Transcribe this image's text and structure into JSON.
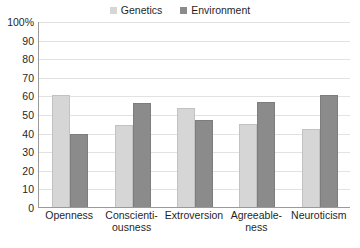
{
  "chart_data": {
    "type": "bar",
    "title": "",
    "xlabel": "",
    "ylabel": "",
    "ylim": [
      0,
      100
    ],
    "yticks": [
      "0",
      "10",
      "20",
      "30",
      "40",
      "50",
      "60",
      "70",
      "80",
      "90",
      "100%"
    ],
    "grid": true,
    "legend_position": "top-center",
    "categories": [
      "Openness",
      "Conscienti-\nousness",
      "Extroversion",
      "Agreeable-\nness",
      "Neuroticism"
    ],
    "series": [
      {
        "name": "Genetics",
        "color": "#d6d6d6",
        "values": [
          60,
          44,
          53,
          44.5,
          42
        ]
      },
      {
        "name": "Environment",
        "color": "#8b8b8b",
        "values": [
          39,
          56,
          47,
          56.5,
          60
        ]
      }
    ]
  },
  "legend": {
    "entries": [
      {
        "label": "Genetics",
        "swatch": "#d6d6d6"
      },
      {
        "label": "Environment",
        "swatch": "#8b8b8b"
      }
    ]
  }
}
